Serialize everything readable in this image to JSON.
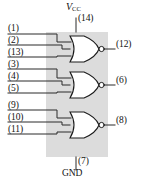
{
  "diagram": {
    "power": {
      "vcc_label": "V",
      "vcc_subscript": "CC",
      "vcc_pin": "(14)",
      "gnd_pin": "(7)",
      "gnd_label": "GND"
    },
    "colors": {
      "body_fill": "#dcdcdc",
      "wire": "#2a2a2a",
      "gate_fill": "#ffffff",
      "gate_stroke": "#1a1a1a",
      "text": "#111111"
    },
    "gates": [
      {
        "name": "gate-1",
        "type": "NOR",
        "inputs": [
          "(1)",
          "(2)",
          "(13)"
        ],
        "output": "(12)"
      },
      {
        "name": "gate-2",
        "type": "NOR",
        "inputs": [
          "(3)",
          "(4)",
          "(5)"
        ],
        "output": "(6)"
      },
      {
        "name": "gate-3",
        "type": "NOR",
        "inputs": [
          "(9)",
          "(10)",
          "(11)"
        ],
        "output": "(8)"
      }
    ]
  }
}
